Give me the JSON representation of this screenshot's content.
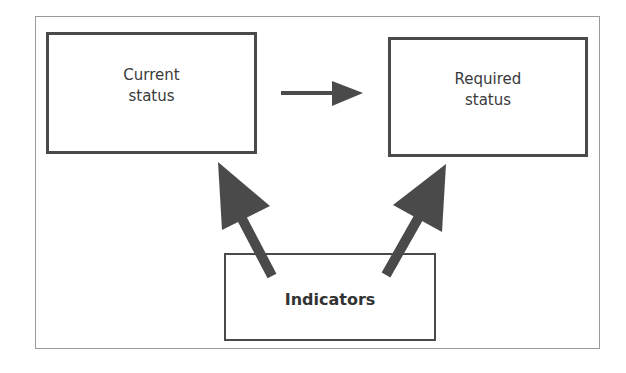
{
  "diagram": {
    "nodes": [
      {
        "id": "current",
        "label_line1": "Current",
        "label_line2": "status"
      },
      {
        "id": "required",
        "label_line1": "Required",
        "label_line2": "status"
      },
      {
        "id": "indicators",
        "label": "Indicators"
      }
    ],
    "edges": [
      {
        "from": "current",
        "to": "required"
      },
      {
        "from": "indicators",
        "to": "current"
      },
      {
        "from": "indicators",
        "to": "required"
      }
    ],
    "colors": {
      "stroke": "#4a4a4a",
      "frame": "#9a9a9a",
      "text": "#3a3a3a"
    }
  }
}
